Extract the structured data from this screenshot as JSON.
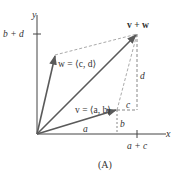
{
  "diagram": {
    "caption": "(A)",
    "axes": {
      "x_label": "x",
      "y_label": "y",
      "x_tick_label": "a + c",
      "y_tick_label": "b + d"
    },
    "vectors": {
      "v_label": "v = ⟨a, b⟩",
      "w_label": "w = ⟨c, d⟩",
      "sum_label": "v + w"
    },
    "components": {
      "a": "a",
      "b": "b",
      "c": "c",
      "d": "d"
    },
    "colors": {
      "vector": "#5a5a5a",
      "axis": "#444444",
      "dashed": "#aaaaaa",
      "text": "#333333"
    }
  }
}
